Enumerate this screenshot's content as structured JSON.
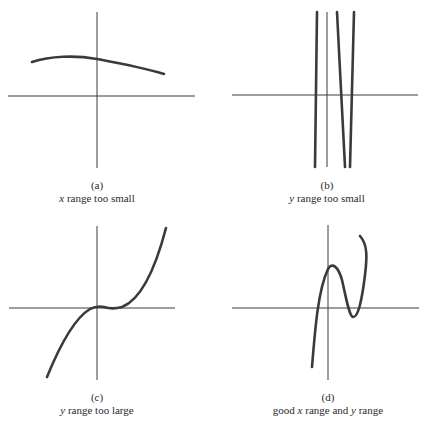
{
  "figure": {
    "panels": [
      {
        "id": "a",
        "tag": "(a)",
        "desc_parts": [
          {
            "text": "x",
            "italic": true
          },
          {
            "text": " range too small",
            "italic": false
          }
        ],
        "description": "x range too small"
      },
      {
        "id": "b",
        "tag": "(b)",
        "desc_parts": [
          {
            "text": "y",
            "italic": true
          },
          {
            "text": " range too small",
            "italic": false
          }
        ],
        "description": "y range too small"
      },
      {
        "id": "c",
        "tag": "(c)",
        "desc_parts": [
          {
            "text": "y",
            "italic": true
          },
          {
            "text": " range too large",
            "italic": false
          }
        ],
        "description": "y range too large"
      },
      {
        "id": "d",
        "tag": "(d)",
        "desc_parts": [
          {
            "text": "good ",
            "italic": false
          },
          {
            "text": "x",
            "italic": true
          },
          {
            "text": " range and ",
            "italic": false
          },
          {
            "text": "y",
            "italic": true
          },
          {
            "text": " range",
            "italic": false
          }
        ],
        "description": "good x range and y range"
      }
    ]
  },
  "colors": {
    "axis": "#3a3a3a",
    "curve": "#3a3a3a",
    "background": "#ffffff"
  }
}
